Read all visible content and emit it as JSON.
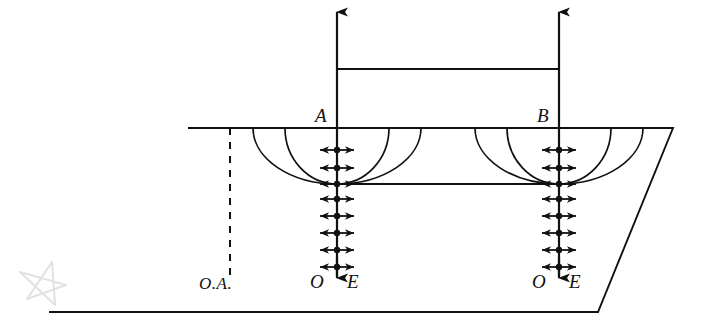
{
  "diagram": {
    "type": "technical-line-diagram",
    "background": "#ffffff",
    "ink_color": "#111111",
    "watermark_color": "#e2e2e2",
    "canvas": {
      "width": 701,
      "height": 332
    }
  },
  "labels": {
    "source_a": "A",
    "source_b": "B",
    "axis_a_left": "O",
    "axis_a_right": "E",
    "axis_b_left": "O",
    "axis_b_right": "E",
    "reference_line": "O.A."
  },
  "geometry": {
    "ground_plane": {
      "name": "parallelogram-ground-plane",
      "top_edge_y": 128,
      "bottom_edge_y": 312,
      "points": "188,128 673,128 598,312 49,312"
    },
    "axis_a": {
      "x": 337,
      "top_y": 10,
      "bottom_y": 278
    },
    "axis_b": {
      "x": 559,
      "top_y": 10,
      "bottom_y": 278
    },
    "tie_line_upper_y": 69,
    "tie_line_lower_y": 184,
    "dashed_reference": {
      "x": 230,
      "top_y": 128,
      "bottom_y": 276
    },
    "arc_half_widths": [
      52,
      84
    ],
    "arc_depth": 56,
    "arrow_half_width": 17,
    "marker_rows_in_plane": [
      150,
      168,
      184
    ],
    "marker_rows_below_plane": [
      199,
      216,
      233,
      250,
      267
    ]
  },
  "elements": {
    "top_arrow_a": "downward-load-arrow-at-A",
    "top_arrow_b": "downward-load-arrow-at-B",
    "bottom_arrow_a": "downward-terminal-arrow-A",
    "bottom_arrow_b": "downward-terminal-arrow-B",
    "bidirectional_markers": "horizontal-double-headed-arrow-with-node-dot",
    "wavefronts": "nested-semi-elliptical-wavefronts"
  }
}
